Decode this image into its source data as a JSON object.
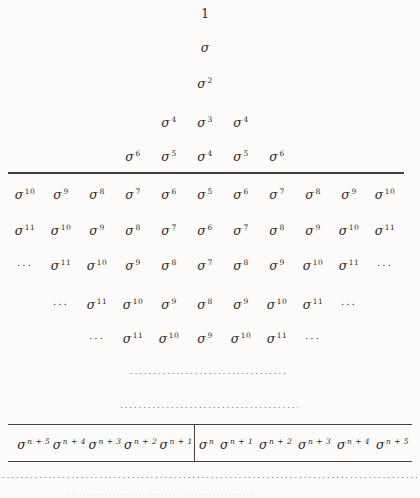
{
  "page": {
    "bg": "#fcfbf9",
    "ink": "#2b2a27",
    "line": "#413f3a"
  },
  "figure": {
    "rows": [
      [
        "",
        "",
        "",
        "",
        "",
        "1",
        "",
        "",
        "",
        "",
        ""
      ],
      [
        "",
        "",
        "",
        "",
        "",
        "σ",
        "",
        "",
        "",
        "",
        ""
      ],
      [
        "",
        "",
        "",
        "",
        "",
        "σ^2",
        "",
        "",
        "",
        "",
        ""
      ],
      [
        "",
        "",
        "",
        "",
        "σ^4",
        "σ^3",
        "σ^4",
        "",
        "",
        "",
        ""
      ],
      [
        "",
        "",
        "",
        "σ^6",
        "σ^5",
        "σ^4",
        "σ^5",
        "σ^6",
        "",
        "",
        ""
      ],
      [
        "σ^10",
        "σ^9",
        "σ^8",
        "σ^7",
        "σ^6",
        "σ^5",
        "σ^6",
        "σ^7",
        "σ^8",
        "σ^9",
        "σ^10"
      ],
      [
        "σ^11",
        "σ^10",
        "σ^9",
        "σ^8",
        "σ^7",
        "σ^6",
        "σ^7",
        "σ^8",
        "σ^9",
        "σ^10",
        "σ^11"
      ],
      [
        "...",
        "σ^11",
        "σ^10",
        "σ^9",
        "σ^8",
        "σ^7",
        "σ^8",
        "σ^9",
        "σ^10",
        "σ^11",
        "..."
      ],
      [
        "",
        "...",
        "σ^11",
        "σ^10",
        "σ^9",
        "σ^8",
        "σ^9",
        "σ^10",
        "σ^11",
        "...",
        ""
      ],
      [
        "",
        "",
        "...",
        "σ^11",
        "σ^10",
        "σ^9",
        "σ^10",
        "σ^11",
        "...",
        "",
        ""
      ]
    ],
    "band": {
      "left": [
        "σ^n + 5",
        "σ^n + 4",
        "σ^n + 3",
        "σ^n + 2",
        "σ^n + 1"
      ],
      "right": [
        "σ^n",
        "σ^n + 1",
        "σ^n + 2",
        "σ^n + 3",
        "σ^n + 4",
        "σ^n + 5"
      ]
    },
    "dots_short_a": "........................................",
    "dots_short_b": ".............................................",
    "dots_full": "..............................................................................................................",
    "remnant_dots": ".................................................."
  }
}
